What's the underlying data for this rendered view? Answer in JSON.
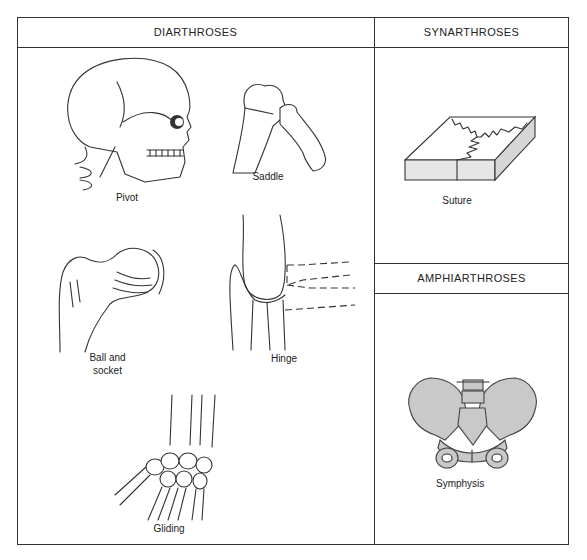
{
  "sections": {
    "diarthroses": {
      "title": "DIARTHROSES",
      "joints": [
        {
          "id": "pivot",
          "label": "Pivot"
        },
        {
          "id": "saddle",
          "label": "Saddle"
        },
        {
          "id": "ball_socket",
          "label_line1": "Ball and",
          "label_line2": "socket"
        },
        {
          "id": "hinge",
          "label": "Hinge"
        },
        {
          "id": "gliding",
          "label": "Gliding"
        }
      ]
    },
    "synarthroses": {
      "title": "SYNARTHROSES",
      "joints": [
        {
          "id": "suture",
          "label": "Suture"
        }
      ]
    },
    "amphiarthroses": {
      "title": "AMPHIARTHROSES",
      "joints": [
        {
          "id": "symphysis",
          "label": "Symphysis"
        }
      ]
    }
  },
  "colors": {
    "line": "#333333",
    "background": "#ffffff",
    "bone_shade": "#c9c9c9"
  }
}
